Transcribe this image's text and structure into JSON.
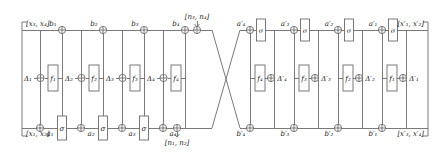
{
  "diagram": {
    "colors": {
      "line": "#6b6b6b",
      "text": "#1a1a1a",
      "bg": "#ffffff"
    },
    "rails": {
      "top_y": 30,
      "mid_y": 78,
      "bottom_y": 128
    },
    "inputs": {
      "top_left": "[x₃, x₄]",
      "bottom_left": "[x₁, x₂]",
      "top_right": "[x′₁, x′₂]",
      "bottom_right": "[x′₃, x′₄]"
    },
    "noise": {
      "top": "[n₃, n₄]",
      "bottom": "[n₁, n₂]"
    },
    "left_half": {
      "top_labels": [
        "b₁",
        "b₂",
        "b₃",
        "b₄"
      ],
      "bottom_labels": [
        "a₁",
        "a₂",
        "a₃",
        "a₄"
      ],
      "sigma_label": "σ",
      "rounds": [
        {
          "delta": "Δ₁",
          "f": "f₁"
        },
        {
          "delta": "Δ₂",
          "f": "f₂"
        },
        {
          "delta": "Δ₃",
          "f": "f₃"
        },
        {
          "delta": "Δ₄",
          "f": "f₄"
        }
      ]
    },
    "right_half": {
      "top_labels": [
        "a′₄",
        "a′₃",
        "a′₂",
        "a′₁"
      ],
      "bottom_labels": [
        "b′₄",
        "b′₃",
        "b′₂",
        "b′₁"
      ],
      "sigma_label": "σ",
      "rounds": [
        {
          "f": "f₄",
          "delta": "Δ′₄"
        },
        {
          "f": "f₃",
          "delta": "Δ′₃"
        },
        {
          "f": "f₂",
          "delta": "Δ′₂"
        },
        {
          "f": "f₁",
          "delta": "Δ′₁"
        }
      ]
    },
    "operators": {
      "xor": "⊕"
    }
  }
}
